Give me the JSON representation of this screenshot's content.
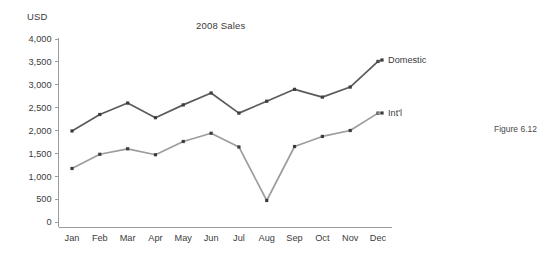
{
  "figure": {
    "caption": "Figure 6.12"
  },
  "chart_data": {
    "type": "line",
    "title": "2008 Sales",
    "xlabel": "",
    "ylabel": "USD",
    "unit_label": "USD",
    "categories": [
      "Jan",
      "Feb",
      "Mar",
      "Apr",
      "May",
      "Jun",
      "Jul",
      "Aug",
      "Sep",
      "Oct",
      "Nov",
      "Dec"
    ],
    "ylim": [
      0,
      4000
    ],
    "yticks": [
      0,
      500,
      1000,
      1500,
      2000,
      2500,
      3000,
      3500,
      4000
    ],
    "ytick_labels": [
      "0",
      "500",
      "1,000",
      "1,500",
      "2,000",
      "2,500",
      "3,000",
      "3,500",
      "4,000"
    ],
    "grid": false,
    "legend_position": "right-inline-labels",
    "series": [
      {
        "name": "Domestic",
        "color": "#5b5b5b",
        "values": [
          1990,
          2350,
          2600,
          2280,
          2560,
          2820,
          2380,
          2640,
          2900,
          2730,
          2950,
          3510
        ]
      },
      {
        "name": "Int'l",
        "color": "#9d9d9d",
        "values": [
          1170,
          1480,
          1600,
          1470,
          1760,
          1940,
          1640,
          470,
          1650,
          1870,
          2000,
          2380
        ]
      }
    ]
  }
}
